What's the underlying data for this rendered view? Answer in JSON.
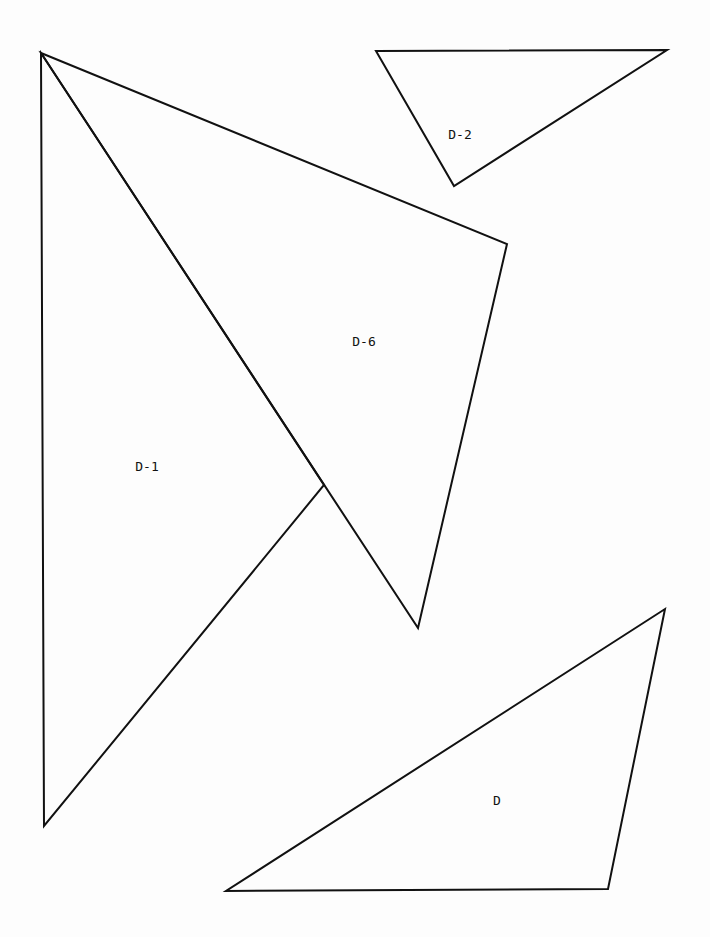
{
  "diagram": {
    "width": 710,
    "height": 937,
    "background": "#fdfdfd",
    "stroke_color": "#111111",
    "shapes": [
      {
        "id": "D-1",
        "label": "D-1",
        "points": [
          [
            41,
            53
          ],
          [
            324,
            485
          ],
          [
            44,
            826
          ]
        ],
        "label_pos": [
          147,
          467
        ]
      },
      {
        "id": "D-6",
        "label": "D-6",
        "points": [
          [
            41,
            53
          ],
          [
            507,
            244
          ],
          [
            418,
            628
          ]
        ],
        "label_pos": [
          364,
          342
        ]
      },
      {
        "id": "D-2",
        "label": "D-2",
        "points": [
          [
            376,
            51
          ],
          [
            667,
            50
          ],
          [
            454,
            186
          ]
        ],
        "label_pos": [
          460,
          135
        ]
      },
      {
        "id": "D",
        "label": "D",
        "points": [
          [
            665,
            609
          ],
          [
            608,
            889
          ],
          [
            226,
            891
          ]
        ],
        "label_pos": [
          497,
          801
        ]
      }
    ]
  }
}
